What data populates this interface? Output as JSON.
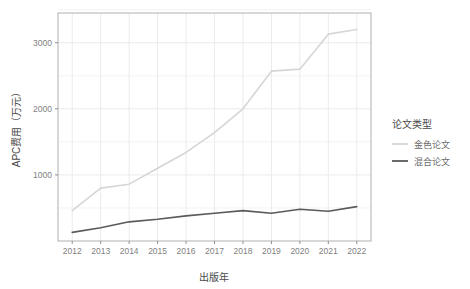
{
  "chart_data": {
    "type": "line",
    "title": "",
    "xlabel": "出版年",
    "ylabel": "APC费用（万元）",
    "x": [
      2012,
      2013,
      2014,
      2015,
      2016,
      2017,
      2018,
      2019,
      2020,
      2021,
      2022
    ],
    "xticklabels": [
      "2012",
      "2013",
      "2014",
      "2015",
      "2016",
      "2017",
      "2018",
      "2019",
      "2020",
      "2021",
      "2022"
    ],
    "yticklabels": [
      "1000",
      "2000",
      "3000"
    ],
    "yticks": [
      1000,
      2000,
      3000
    ],
    "xlim": [
      2011.5,
      2022.5
    ],
    "ylim": [
      0,
      3450
    ],
    "grid": true,
    "legend_position": "right",
    "legend_title": "论文类型",
    "series": [
      {
        "name": "金色论文",
        "color": "#d6d6d6",
        "values": [
          460,
          800,
          860,
          1100,
          1340,
          1640,
          2000,
          2570,
          2600,
          3130,
          3200
        ]
      },
      {
        "name": "混合论文",
        "color": "#5a5a5a",
        "values": [
          130,
          200,
          290,
          330,
          380,
          420,
          460,
          420,
          480,
          450,
          520
        ]
      }
    ]
  },
  "panel": {
    "bg_color": "#ffffff",
    "grid_color": "#ebebeb",
    "border_color": "#b0b0b0",
    "tick_color": "#8f8f8f"
  }
}
